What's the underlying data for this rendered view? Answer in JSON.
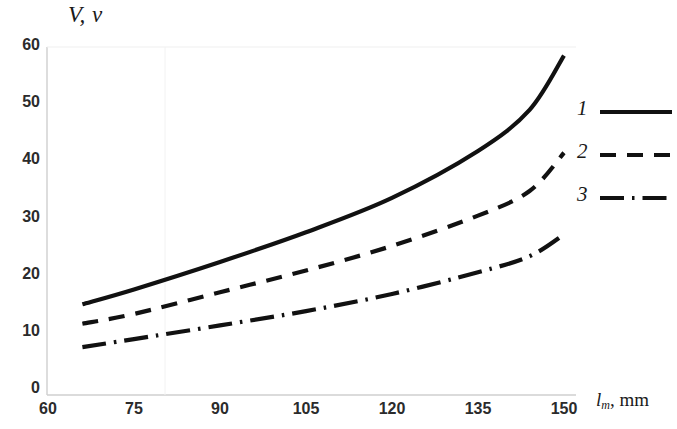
{
  "chart_data": {
    "type": "line",
    "title": "",
    "ylabel": "V, v",
    "xlabel": "l_m, mm",
    "xlabel_main": "l",
    "xlabel_sub": "m",
    "xlabel_unit": ", mm",
    "xlim": [
      60,
      153
    ],
    "ylim": [
      0,
      63
    ],
    "grid": false,
    "legend_position": "right",
    "xticks": [
      "60",
      "75",
      "90",
      "105",
      "120",
      "135",
      "150"
    ],
    "xtick_values": [
      60,
      75,
      90,
      105,
      120,
      135,
      150
    ],
    "yticks": [
      "0",
      "10",
      "20",
      "30",
      "40",
      "50",
      "60"
    ],
    "ytick_values": [
      0,
      10,
      20,
      30,
      40,
      50,
      60
    ],
    "x": [
      66,
      75,
      90,
      105,
      120,
      135,
      144,
      150
    ],
    "series": [
      {
        "name": "1",
        "legend_label": "1",
        "style": "solid",
        "color": "#111111",
        "values": [
          15.0,
          17.6,
          22.4,
          27.6,
          33.6,
          41.8,
          49.0,
          58.5
        ]
      },
      {
        "name": "2",
        "legend_label": "2",
        "style": "dashed",
        "color": "#111111",
        "values": [
          11.6,
          13.3,
          17.1,
          20.9,
          25.2,
          30.5,
          34.8,
          41.5
        ]
      },
      {
        "name": "3",
        "legend_label": "3",
        "style": "dashdot",
        "color": "#111111",
        "values": [
          7.5,
          8.9,
          11.3,
          13.8,
          16.8,
          20.6,
          23.4,
          27.2
        ]
      }
    ]
  },
  "axes": {
    "y_title": "V, v",
    "x_title_italic": "l",
    "x_title_sub": "m",
    "x_title_rest": ", mm"
  },
  "legend": {
    "items": [
      {
        "label": "1",
        "style": "solid"
      },
      {
        "label": "2",
        "style": "dashed"
      },
      {
        "label": "3",
        "style": "dashdot"
      }
    ]
  }
}
